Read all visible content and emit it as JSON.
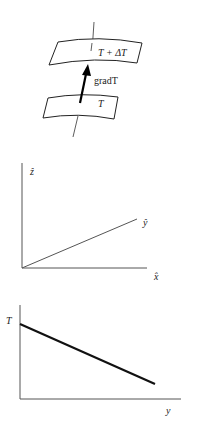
{
  "figure_1": {
    "upper_surface_label": "T + ΔT",
    "lower_surface_label": "T",
    "arrow_label": "gradT"
  },
  "figure_2": {
    "axis_z_label": "ẑ",
    "axis_y_label": "ŷ",
    "axis_x_label": "x̂"
  },
  "figure_3": {
    "y_axis_label": "T",
    "x_axis_label": "y"
  },
  "colors": {
    "line": "#222222",
    "axis": "#555555",
    "background": "#ffffff"
  }
}
